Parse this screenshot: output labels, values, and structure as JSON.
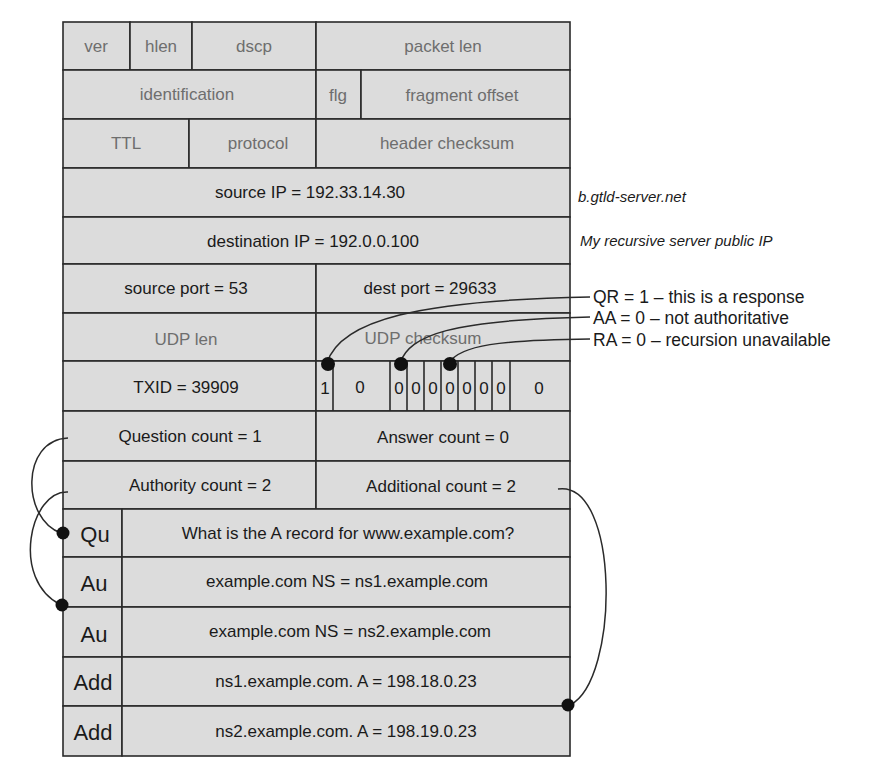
{
  "diagram": {
    "ip_header": {
      "ver": "ver",
      "hlen": "hlen",
      "dscp": "dscp",
      "packet_len": "packet len",
      "identification": "identification",
      "flg": "flg",
      "fragment_offset": "fragment offset",
      "ttl": "TTL",
      "protocol": "protocol",
      "header_checksum": "header checksum",
      "source_ip": "source IP = 192.33.14.30",
      "destination_ip": "destination IP = 192.0.0.100"
    },
    "udp_header": {
      "source_port": "source port = 53",
      "dest_port": "dest port = 29633",
      "udp_len": "UDP len",
      "udp_checksum": "UDP checksum"
    },
    "dns_header": {
      "txid": "TXID = 39909",
      "flag_bits": [
        "1",
        "0",
        "0",
        "0",
        "0",
        "0",
        "0",
        "0",
        "0",
        "0"
      ],
      "question_count": "Question count = 1",
      "answer_count": "Answer count = 0",
      "authority_count": "Authority count = 2",
      "additional_count": "Additional count = 2"
    },
    "records": [
      {
        "section": "Qu",
        "content": "What is the A record for www.example.com?"
      },
      {
        "section": "Au",
        "content": "example.com NS = ns1.example.com"
      },
      {
        "section": "Au",
        "content": "example.com NS = ns2.example.com"
      },
      {
        "section": "Add",
        "content": "ns1.example.com. A = 198.18.0.23"
      },
      {
        "section": "Add",
        "content": "ns2.example.com. A = 198.19.0.23"
      }
    ],
    "side_notes": {
      "source_ip_note": "b.gtld-server.net",
      "destination_ip_note": "My recursive server public IP"
    },
    "flag_annotations": [
      "QR = 1 – this is a response",
      "AA = 0 – not authoritative",
      "RA = 0 – recursion unavailable"
    ],
    "colors": {
      "cell_fill": "#dcdcdc",
      "line": "#2a2a2a",
      "text": "#1a1a1a",
      "muted_text": "#6e6e6e"
    }
  }
}
